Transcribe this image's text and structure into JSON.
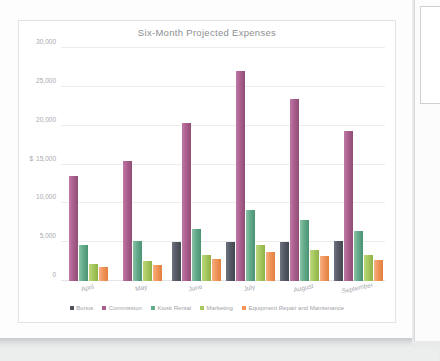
{
  "document": {
    "bottom_caption": ""
  },
  "chart_data": {
    "type": "bar",
    "title": "Six-Month Projected Expenses",
    "xlabel": "",
    "ylabel": "",
    "ylim": [
      0,
      30000
    ],
    "yticks": [
      0,
      5000,
      10000,
      15000,
      20000,
      25000,
      30000
    ],
    "ytick_labels": [
      "0",
      "5,000",
      "10,000",
      "15,000",
      "20,000",
      "25,000",
      "30,000"
    ],
    "currency_symbol": "$",
    "currency_tick_index": 3,
    "grid": true,
    "legend_position": "bottom",
    "categories": [
      "April",
      "May",
      "June",
      "July",
      "August",
      "September"
    ],
    "series": [
      {
        "name": "Bonus",
        "color": "#4d525d",
        "values": [
          0,
          0,
          5000,
          5000,
          5050,
          5100
        ]
      },
      {
        "name": "Commission",
        "color": "#ab5f8e",
        "values": [
          13500,
          15500,
          20300,
          27000,
          23400,
          19300
        ]
      },
      {
        "name": "Kiosk Rental",
        "color": "#63ab8b",
        "values": [
          4600,
          5150,
          6650,
          9100,
          7800,
          6400
        ]
      },
      {
        "name": "Marketing",
        "color": "#a7c85f",
        "values": [
          2200,
          2600,
          3400,
          4600,
          4000,
          3300
        ]
      },
      {
        "name": "Equipment Repair and Maintenance",
        "color": "#f0955a",
        "values": [
          1750,
          2050,
          2800,
          3800,
          3200,
          2650
        ]
      }
    ]
  }
}
